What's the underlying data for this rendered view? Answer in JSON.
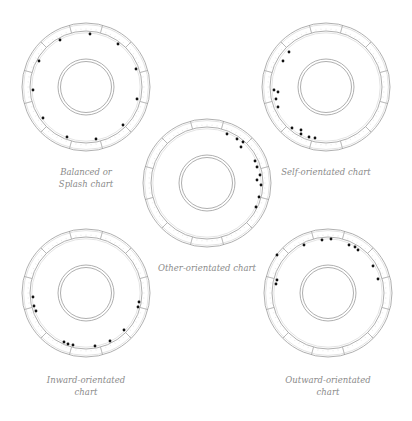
{
  "diagram": {
    "style": {
      "ring_color": "#9a9a9a",
      "tick_color": "#c8c8c8",
      "dot_color": "#111111",
      "caption_color": "#8a8a8a",
      "background": "#ffffff"
    },
    "geometry": {
      "outer_radius": 64,
      "ring_inner_radius": 56,
      "track_radius": 53,
      "hub_outer_radius": 28,
      "hub_inner_radius": 25.5,
      "segments": 12,
      "segment_offset_deg": 15,
      "dot_radius": 1.4
    },
    "charts": [
      {
        "id": "balanced",
        "caption_lines": [
          "Balanced or",
          "Splash chart"
        ],
        "center": [
          86,
          87
        ],
        "caption_pos": [
          86,
          166
        ],
        "dots": [
          [
            60,
            40
          ],
          [
            90,
            34
          ],
          [
            118,
            44
          ],
          [
            136,
            69
          ],
          [
            137,
            99
          ],
          [
            123,
            125
          ],
          [
            96,
            139
          ],
          [
            67,
            137
          ],
          [
            43,
            118
          ],
          [
            33,
            90
          ],
          [
            39,
            61
          ]
        ]
      },
      {
        "id": "self",
        "caption_lines": [
          "Self-orientated chart"
        ],
        "center": [
          326,
          87
        ],
        "caption_pos": [
          326,
          166
        ],
        "dots": [
          [
            289,
            52
          ],
          [
            283,
            61
          ],
          [
            274,
            90
          ],
          [
            278,
            92
          ],
          [
            276,
            99
          ],
          [
            278,
            107
          ],
          [
            292,
            128
          ],
          [
            301,
            130
          ],
          [
            301,
            134
          ],
          [
            309,
            137
          ],
          [
            315,
            138
          ]
        ]
      },
      {
        "id": "other",
        "caption_lines": [
          "Other-orientated chart"
        ],
        "center": [
          207,
          183
        ],
        "caption_pos": [
          207,
          262
        ],
        "dots": [
          [
            227,
            134
          ],
          [
            237,
            139
          ],
          [
            243,
            142
          ],
          [
            241,
            147
          ],
          [
            255,
            161
          ],
          [
            257,
            167
          ],
          [
            260,
            175
          ],
          [
            257,
            180
          ],
          [
            261,
            185
          ],
          [
            259,
            197
          ],
          [
            256,
            207
          ]
        ]
      },
      {
        "id": "inward",
        "caption_lines": [
          "Inward-orientated",
          "chart"
        ],
        "center": [
          86,
          293
        ],
        "caption_pos": [
          86,
          374
        ],
        "dots": [
          [
            33,
            297
          ],
          [
            34,
            306
          ],
          [
            36,
            311
          ],
          [
            139,
            302
          ],
          [
            138,
            307
          ],
          [
            124,
            330
          ],
          [
            110,
            341
          ],
          [
            64,
            342
          ],
          [
            68,
            344
          ],
          [
            73,
            345
          ],
          [
            95,
            346
          ]
        ]
      },
      {
        "id": "outward",
        "caption_lines": [
          "Outward-orientated",
          "chart"
        ],
        "center": [
          328,
          293
        ],
        "caption_pos": [
          328,
          374
        ],
        "dots": [
          [
            304,
            245
          ],
          [
            322,
            240
          ],
          [
            331,
            239
          ],
          [
            349,
            245
          ],
          [
            355,
            247
          ],
          [
            358,
            250
          ],
          [
            373,
            266
          ],
          [
            378,
            279
          ],
          [
            277,
            255
          ],
          [
            277,
            280
          ],
          [
            276,
            284
          ]
        ]
      }
    ]
  }
}
